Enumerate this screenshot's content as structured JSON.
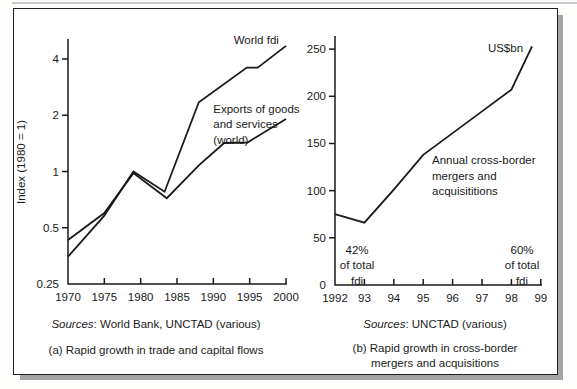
{
  "colors": {
    "line": "#1a1a1a",
    "shadow": "#a5a5a5"
  },
  "chart_data": [
    {
      "type": "line",
      "panel": "a",
      "caption_lines": [
        "(a) Rapid growth in trade and capital flows"
      ],
      "sources_label": "Sources",
      "sources_rest": ": World Bank, UNCTAD (various)",
      "ylabel": "Index (1980 = 1)",
      "yscale": "log",
      "xlim": [
        1970,
        2000
      ],
      "ylim": [
        0.25,
        4.8
      ],
      "grid": false,
      "xtick_values": [
        1970,
        1975,
        1980,
        1985,
        1990,
        1995,
        2000
      ],
      "xtick_labels": [
        "1970",
        "1975",
        "1980",
        "1985",
        "1990",
        "1995",
        "2000"
      ],
      "ytick_values": [
        4,
        2,
        1,
        0.5,
        0.25
      ],
      "ytick_labels": [
        "4",
        "2",
        "1",
        "0.5",
        "0.25"
      ],
      "series": [
        {
          "name": "World fdi",
          "points": [
            [
              1970,
              0.35
            ],
            [
              1975,
              0.58
            ],
            [
              1979,
              1.0
            ],
            [
              1983.3,
              0.78
            ],
            [
              1988,
              2.35
            ],
            [
              1994.6,
              3.6
            ],
            [
              1996.1,
              3.6
            ],
            [
              2000,
              4.7
            ]
          ]
        },
        {
          "name": "Exports of goods and services (world)",
          "points": [
            [
              1970,
              0.43
            ],
            [
              1975,
              0.6
            ],
            [
              1979,
              0.98
            ],
            [
              1983.6,
              0.72
            ],
            [
              1988,
              1.08
            ],
            [
              1991.5,
              1.42
            ],
            [
              1994.7,
              1.43
            ],
            [
              2000,
              1.91
            ]
          ]
        }
      ],
      "labels": [
        {
          "lines": [
            "World fdi"
          ],
          "x": 1992.8,
          "y": 4.8,
          "anchor": "start"
        },
        {
          "lines": [
            "Exports of goods",
            "and services",
            "(world)"
          ],
          "x": 1990,
          "y": 2.06,
          "anchor": "start"
        }
      ]
    },
    {
      "type": "line",
      "panel": "b",
      "caption_lines": [
        "(b) Rapid growth in cross-border",
        "mergers and acquisitions"
      ],
      "sources_label": "Sources",
      "sources_rest": ": UNCTAD (various)",
      "ylabel": "",
      "yscale": "linear",
      "xlim": [
        1992,
        1999
      ],
      "ylim": [
        0,
        260
      ],
      "grid": false,
      "xtick_values": [
        1992,
        1993,
        1994,
        1995,
        1996,
        1997,
        1998,
        1999
      ],
      "xtick_labels": [
        "1992",
        "93",
        "94",
        "95",
        "96",
        "97",
        "98",
        "99"
      ],
      "ytick_values": [
        0,
        50,
        100,
        150,
        200,
        250
      ],
      "ytick_labels": [
        "0",
        "50",
        "100",
        "150",
        "200",
        "250"
      ],
      "series": [
        {
          "name": "Annual cross-border mergers and acquisitions",
          "points": [
            [
              1992,
              75
            ],
            [
              1993,
              66
            ],
            [
              1994,
              101
            ],
            [
              1995,
              138
            ],
            [
              1996,
              161
            ],
            [
              1997,
              184
            ],
            [
              1998,
              207
            ],
            [
              1998.7,
              253
            ]
          ]
        }
      ],
      "labels": [
        {
          "lines": [
            "US$bn"
          ],
          "x": 1997.2,
          "y": 247,
          "anchor": "start"
        },
        {
          "lines": [
            "Annual cross-border",
            "mergers and",
            "acquisititions"
          ],
          "x": 1995.3,
          "y": 128,
          "anchor": "start"
        },
        {
          "lines": [
            "42%",
            "of total",
            "fdi"
          ],
          "x": 1992.75,
          "y": 33,
          "anchor": "middle"
        },
        {
          "lines": [
            "60%",
            "of total",
            "fdi"
          ],
          "x": 1998.36,
          "y": 33,
          "anchor": "middle"
        }
      ]
    }
  ]
}
